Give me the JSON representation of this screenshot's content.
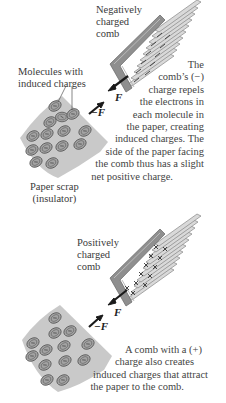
{
  "panel_top": {
    "comb_label": [
      "Negatively",
      "charged",
      "comb"
    ],
    "molecules_label": [
      "Molecules with",
      "induced charges"
    ],
    "paper_label": [
      "Paper scrap",
      "(insulator)"
    ],
    "force_on_paper": "−F",
    "force_on_comb": "F",
    "caption": [
      "The",
      "comb’s (−)",
      "charge repels",
      "the electrons in",
      "each molecule in",
      "the paper, creating",
      "induced charges. The",
      "side of the paper facing",
      "the comb thus has a slight",
      "net positive charge."
    ],
    "comb_charge_symbol": "−"
  },
  "panel_bottom": {
    "comb_label": [
      "Positively",
      "charged",
      "comb"
    ],
    "force_on_paper": "−F",
    "force_on_comb": "F",
    "caption": [
      "A comb with a (+)",
      "charge also creates",
      "induced charges that attract",
      "the paper to the comb."
    ],
    "comb_charge_symbol": "+"
  },
  "colors": {
    "paper": "#c9c9c9",
    "comb_body": "#8f8f8f",
    "comb_edge": "#6e6e6e",
    "tooth": "#d8d8d8",
    "molecule": "#9a9a9a",
    "arrow": "#1a1a1a"
  }
}
